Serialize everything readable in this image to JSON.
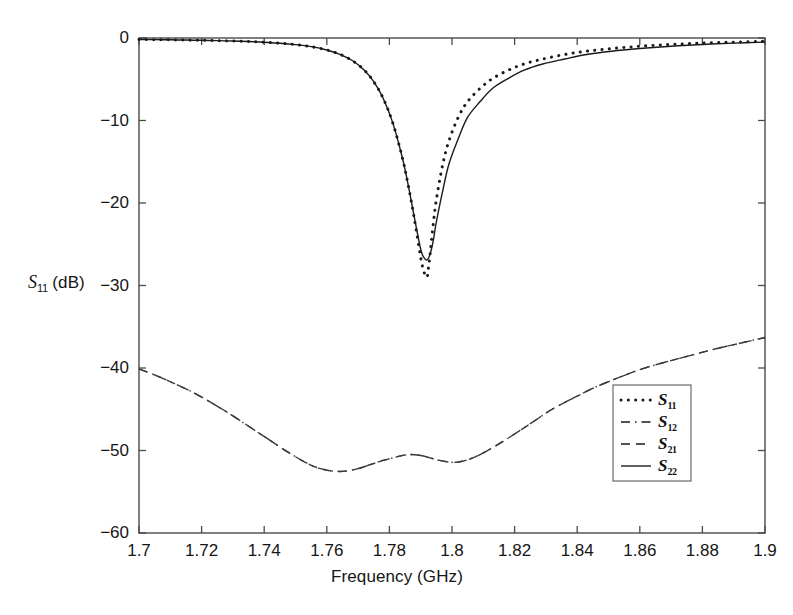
{
  "figure": {
    "background_color": "#ffffff",
    "axis_color": "#4a4a4a",
    "curve_color": "#1a1a1a"
  },
  "chart_data": {
    "type": "line",
    "title": "",
    "xlabel": "Frequency (GHz)",
    "ylabel": "S11 (dB)",
    "ylabel_base": "S",
    "ylabel_sub": "11",
    "ylabel_unit": " (dB)",
    "xlim": [
      1.7,
      1.9
    ],
    "ylim": [
      -60,
      0
    ],
    "xticks": [
      1.7,
      1.72,
      1.74,
      1.76,
      1.78,
      1.8,
      1.82,
      1.84,
      1.86,
      1.88,
      1.9
    ],
    "xticklabels": [
      "1.7",
      "1.72",
      "1.74",
      "1.76",
      "1.78",
      "1.8",
      "1.82",
      "1.84",
      "1.86",
      "1.88",
      "1.9"
    ],
    "yticks": [
      0,
      -10,
      -20,
      -30,
      -40,
      -50,
      -60
    ],
    "yticklabels": [
      "0",
      "-10",
      "-20",
      "-30",
      "-40",
      "-50",
      "-60"
    ],
    "grid": false,
    "legend_position": "center-right",
    "series": [
      {
        "name": "S11",
        "label_base": "S",
        "label_sub": "11",
        "style": "dotted",
        "color": "#1a1a1a",
        "x": [
          1.7,
          1.705,
          1.71,
          1.715,
          1.72,
          1.725,
          1.73,
          1.735,
          1.74,
          1.745,
          1.75,
          1.755,
          1.76,
          1.764,
          1.768,
          1.772,
          1.775,
          1.778,
          1.781,
          1.784,
          1.786,
          1.788,
          1.79,
          1.791,
          1.792,
          1.7925,
          1.793,
          1.794,
          1.795,
          1.797,
          1.799,
          1.802,
          1.805,
          1.809,
          1.813,
          1.818,
          1.823,
          1.829,
          1.836,
          1.843,
          1.851,
          1.86,
          1.87,
          1.88,
          1.89,
          1.9
        ],
        "y": [
          -0.18,
          -0.2,
          -0.22,
          -0.25,
          -0.28,
          -0.32,
          -0.37,
          -0.43,
          -0.52,
          -0.63,
          -0.8,
          -1.05,
          -1.45,
          -1.95,
          -2.7,
          -3.9,
          -5.3,
          -7.3,
          -10.2,
          -14.3,
          -17.8,
          -22.0,
          -26.6,
          -28.3,
          -29.0,
          -27.8,
          -26.2,
          -22.6,
          -19.6,
          -15.4,
          -12.5,
          -9.6,
          -7.7,
          -6.1,
          -4.9,
          -3.9,
          -3.15,
          -2.55,
          -2.0,
          -1.6,
          -1.28,
          -1.0,
          -0.78,
          -0.62,
          -0.5,
          -0.4
        ]
      },
      {
        "name": "S22",
        "label_base": "S",
        "label_sub": "22",
        "style": "solid",
        "color": "#1a1a1a",
        "x": [
          1.7,
          1.705,
          1.71,
          1.715,
          1.72,
          1.725,
          1.73,
          1.735,
          1.74,
          1.745,
          1.75,
          1.755,
          1.76,
          1.764,
          1.768,
          1.772,
          1.775,
          1.778,
          1.781,
          1.784,
          1.786,
          1.788,
          1.79,
          1.791,
          1.792,
          1.793,
          1.794,
          1.795,
          1.797,
          1.799,
          1.802,
          1.805,
          1.809,
          1.813,
          1.818,
          1.823,
          1.829,
          1.836,
          1.843,
          1.851,
          1.86,
          1.87,
          1.88,
          1.89,
          1.9
        ],
        "y": [
          -0.18,
          -0.2,
          -0.22,
          -0.25,
          -0.28,
          -0.32,
          -0.37,
          -0.43,
          -0.52,
          -0.63,
          -0.8,
          -1.05,
          -1.45,
          -1.95,
          -2.7,
          -3.9,
          -5.3,
          -7.3,
          -10.2,
          -14.3,
          -17.8,
          -21.8,
          -25.6,
          -26.6,
          -26.9,
          -26.2,
          -24.6,
          -22.3,
          -18.6,
          -15.3,
          -12.2,
          -9.6,
          -7.7,
          -6.1,
          -4.9,
          -3.9,
          -3.15,
          -2.55,
          -2.0,
          -1.6,
          -1.28,
          -1.0,
          -0.78,
          -0.62,
          -0.5
        ]
      },
      {
        "name": "S21",
        "label_base": "S",
        "label_sub": "21",
        "style": "dashed",
        "color": "#3a3a3a",
        "x": [
          1.7,
          1.706,
          1.712,
          1.718,
          1.724,
          1.73,
          1.736,
          1.742,
          1.748,
          1.754,
          1.758,
          1.762,
          1.766,
          1.77,
          1.774,
          1.778,
          1.782,
          1.786,
          1.79,
          1.793,
          1.796,
          1.799,
          1.802,
          1.806,
          1.81,
          1.815,
          1.82,
          1.826,
          1.832,
          1.839,
          1.846,
          1.853,
          1.86,
          1.868,
          1.876,
          1.884,
          1.892,
          1.9
        ],
        "y": [
          -40.1,
          -41.0,
          -42.0,
          -43.1,
          -44.4,
          -45.8,
          -47.3,
          -48.8,
          -50.3,
          -51.6,
          -52.2,
          -52.5,
          -52.5,
          -52.2,
          -51.7,
          -51.2,
          -50.8,
          -50.5,
          -50.6,
          -50.9,
          -51.2,
          -51.4,
          -51.4,
          -51.0,
          -50.3,
          -49.2,
          -48.0,
          -46.5,
          -45.0,
          -43.6,
          -42.3,
          -41.2,
          -40.2,
          -39.3,
          -38.5,
          -37.7,
          -37.0,
          -36.3
        ]
      },
      {
        "name": "S12",
        "label_base": "S",
        "label_sub": "12",
        "style": "dashdot",
        "color": "#3a3a3a",
        "x": [
          1.7,
          1.706,
          1.712,
          1.718,
          1.724,
          1.73,
          1.736,
          1.742,
          1.748,
          1.754,
          1.758,
          1.762,
          1.766,
          1.77,
          1.774,
          1.778,
          1.782,
          1.786,
          1.79,
          1.793,
          1.796,
          1.799,
          1.802,
          1.806,
          1.81,
          1.815,
          1.82,
          1.826,
          1.832,
          1.839,
          1.846,
          1.853,
          1.86,
          1.868,
          1.876,
          1.884,
          1.892,
          1.9
        ],
        "y": [
          -40.1,
          -41.0,
          -42.0,
          -43.1,
          -44.4,
          -45.8,
          -47.3,
          -48.8,
          -50.3,
          -51.6,
          -52.2,
          -52.5,
          -52.5,
          -52.2,
          -51.7,
          -51.2,
          -50.8,
          -50.5,
          -50.6,
          -50.9,
          -51.2,
          -51.4,
          -51.4,
          -51.0,
          -50.3,
          -49.2,
          -48.0,
          -46.5,
          -45.0,
          -43.6,
          -42.3,
          -41.2,
          -40.2,
          -39.3,
          -38.5,
          -37.7,
          -37.0,
          -36.3
        ]
      }
    ],
    "legend_entries": [
      {
        "base": "S",
        "sub": "11",
        "style": "dotted"
      },
      {
        "base": "S",
        "sub": "12",
        "style": "dashdot"
      },
      {
        "base": "S",
        "sub": "21",
        "style": "dashed"
      },
      {
        "base": "S",
        "sub": "22",
        "style": "solid"
      }
    ]
  }
}
